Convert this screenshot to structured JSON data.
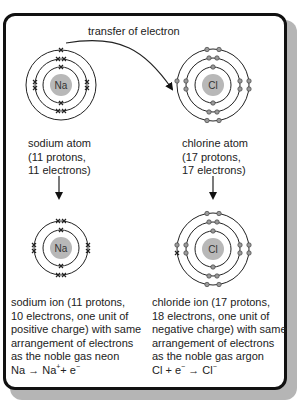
{
  "diagram": {
    "title": "transfer of electron",
    "colors": {
      "nucleus": "#b8b8b8",
      "shell": "#222222",
      "frame": "#111111",
      "shadow": "#b5b5b5",
      "cl_electron": "#9a9a9a"
    },
    "sodium_atom": {
      "symbol": "Na",
      "label": [
        "sodium atom",
        "(11 protons,",
        "11 electrons)"
      ],
      "shells": [
        2,
        8,
        1
      ],
      "electron_mark": "x"
    },
    "chlorine_atom": {
      "symbol": "Cl",
      "label": [
        "chlorine atom",
        "(17 protons,",
        "17 electrons)"
      ],
      "shells": [
        2,
        8,
        7
      ],
      "electron_mark": "o"
    },
    "sodium_ion": {
      "symbol": "Na",
      "shells": [
        2,
        8
      ],
      "description": [
        "sodium ion (11 protons,",
        "10 electrons, one unit of",
        "positive charge) with same",
        "arrangement of electrons",
        "as the noble gas neon"
      ],
      "equation": {
        "lhs": "Na",
        "arrow": "→",
        "rhs_base": "Na",
        "rhs_charge": "+",
        "plus": "+ e",
        "electron_charge": "−"
      }
    },
    "chloride_ion": {
      "symbol": "Cl",
      "shells": [
        2,
        8,
        8
      ],
      "description": [
        "chloride ion (17 protons,",
        "18 electrons, one unit of",
        "negative charge) with same",
        "arrangement of electrons",
        "as the noble gas argon"
      ],
      "equation": {
        "lhs": "Cl + e",
        "electron_charge": "−",
        "arrow": "→",
        "rhs_base": "Cl",
        "rhs_charge": "−"
      }
    }
  }
}
